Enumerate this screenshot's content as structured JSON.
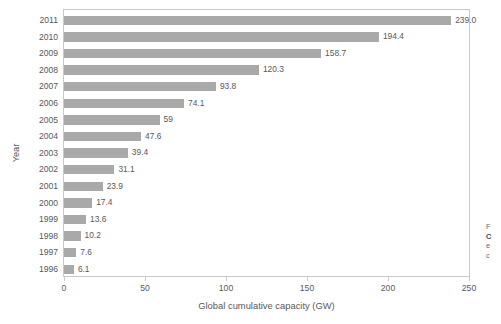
{
  "chart_data": {
    "type": "bar",
    "orientation": "horizontal",
    "title": "",
    "xlabel": "Global cumulative capacity (GW)",
    "ylabel": "Year",
    "xlim": [
      0,
      250
    ],
    "xticks": [
      0,
      50,
      100,
      150,
      200,
      250
    ],
    "xtick_labels": [
      "0",
      "50",
      "100",
      "150",
      "200",
      "250"
    ],
    "grid": false,
    "legend": "none",
    "bar_color": "#a9a9a9",
    "categories": [
      "2011",
      "2010",
      "2009",
      "2008",
      "2007",
      "2006",
      "2005",
      "2004",
      "2003",
      "2002",
      "2001",
      "2000",
      "1999",
      "1998",
      "1997",
      "1996"
    ],
    "values": [
      239.0,
      194.4,
      158.7,
      120.3,
      93.8,
      74.1,
      59,
      47.6,
      39.4,
      31.1,
      23.9,
      17.4,
      13.6,
      10.2,
      7.6,
      6.1
    ],
    "value_labels": [
      "239.0",
      "194.4",
      "158.7",
      "120.3",
      "93.8",
      "74.1",
      "59",
      "47.6",
      "39.4",
      "31.1",
      "23.9",
      "17.4",
      "13.6",
      "10.2",
      "7.6",
      "6.1"
    ]
  },
  "caption": {
    "lines": [
      "F",
      "C",
      "e",
      "c"
    ],
    "note": "caption clipped at image right edge"
  }
}
